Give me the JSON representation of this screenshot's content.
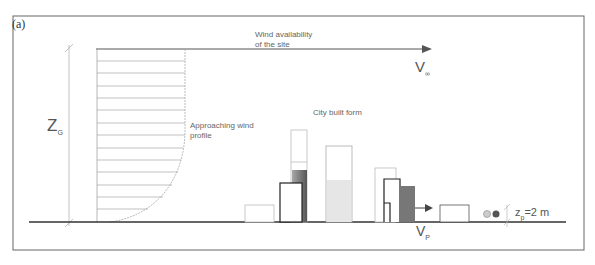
{
  "figure": {
    "panel_label": "(a)",
    "labels": {
      "wind_availability_line1": "Wind availability",
      "wind_availability_line2": "of the site",
      "v_inf_main": "V",
      "v_inf_sub": "∞",
      "z_g_main": "Z",
      "z_g_sub": "G",
      "approach_line1": "Approaching wind",
      "approach_line2": "profile",
      "city_built_form": "City built form",
      "v_p_main": "V",
      "v_p_sub": "P",
      "z_p_main": "z",
      "z_p_sub": "p",
      "z_p_value": "=2 m"
    },
    "colors": {
      "line": "#555555",
      "frame": "#666666",
      "ground": "#333333",
      "light_fill": "#e2e2e2",
      "dark_fill": "#7a7a7a",
      "faint_outline": "#bbbbbb",
      "bold_outline": "#222222"
    }
  }
}
